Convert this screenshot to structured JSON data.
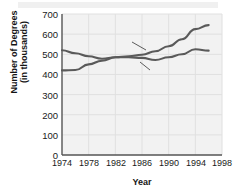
{
  "chart_data": {
    "type": "line",
    "title": "",
    "xlabel": "Year",
    "ylabel_line1": "Number of Degrees",
    "ylabel_line2": "(in thousands)",
    "x": [
      1974,
      1976,
      1978,
      1980,
      1982,
      1984,
      1986,
      1988,
      1990,
      1992,
      1994,
      1996
    ],
    "xlim": [
      1974,
      1998
    ],
    "ylim": [
      0,
      700
    ],
    "xticks": [
      "1974",
      "1978",
      "1982",
      "1986",
      "1990",
      "1994",
      "1998"
    ],
    "yticks": [
      "0",
      "100",
      "200",
      "300",
      "400",
      "500",
      "600",
      "700"
    ],
    "grid": true,
    "legend": "inline-labels",
    "series": [
      {
        "name": "Women",
        "label": "Women",
        "values": [
          420,
          422,
          450,
          468,
          485,
          490,
          498,
          515,
          540,
          575,
          625,
          645
        ]
      },
      {
        "name": "Men",
        "label": "Men",
        "values": [
          520,
          505,
          490,
          478,
          485,
          485,
          482,
          472,
          485,
          500,
          525,
          518
        ]
      }
    ],
    "colors": {
      "line": "#5a5a5a",
      "plot_background": "#f2f2f2",
      "gridline": "#e0e0e0",
      "axis": "#555555",
      "text": "#1a1a1a",
      "series_label": "#4a4a4a"
    }
  }
}
